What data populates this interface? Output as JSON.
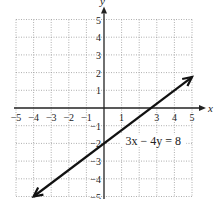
{
  "chart_data": {
    "type": "line",
    "title": "",
    "xlabel": "x",
    "ylabel": "y",
    "xlim": [
      -5,
      5
    ],
    "ylim": [
      -5,
      5
    ],
    "grid": true,
    "x_ticks": [
      -5,
      -4,
      -3,
      -2,
      -1,
      1,
      3,
      4,
      5
    ],
    "x_tick_labels": [
      "−5",
      "−4",
      "−3",
      "−2",
      "−1",
      "1",
      "3",
      "4",
      "5"
    ],
    "y_ticks": [
      5,
      4,
      3,
      2,
      1,
      -1,
      -2,
      -3,
      -4,
      -5
    ],
    "y_tick_labels": [
      "5",
      "4",
      "3",
      "2",
      "1",
      "−1",
      "−2",
      "−3",
      "−4",
      "−5"
    ],
    "series": [
      {
        "name": "3x - 4y = 8",
        "equation": "3x − 4y = 8",
        "slope": 0.75,
        "intercept": -2,
        "x": [
          -4,
          5
        ],
        "y": [
          -5,
          1.75
        ],
        "arrows": "both"
      }
    ],
    "annotations": [
      {
        "text": "3x − 4y = 8",
        "x": 2.8,
        "y": -2
      }
    ]
  }
}
